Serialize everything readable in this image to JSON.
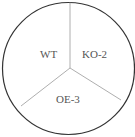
{
  "diagram": {
    "type": "sectored-plate",
    "sectors": [
      {
        "label": "WT"
      },
      {
        "label": "KO-2"
      },
      {
        "label": "OE-3"
      }
    ],
    "colors": {
      "outline": "#333333",
      "divider": "#999999",
      "text": "#555555",
      "background": "#ffffff"
    }
  }
}
